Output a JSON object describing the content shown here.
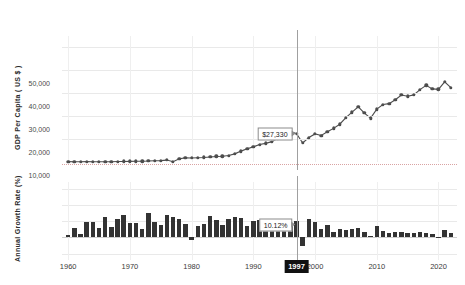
{
  "chart_data": {
    "type": "line",
    "title": "",
    "panels": [
      {
        "name": "gdp-per-capita",
        "type": "line",
        "ylabel": "GDP Per Capita ( US $ )",
        "xlabel": "",
        "ylim": [
          0,
          55000
        ],
        "yticks": [
          10000,
          20000,
          30000,
          40000,
          50000
        ],
        "ytick_labels": [
          "10,000",
          "20,000",
          "30,000",
          "40,000",
          "50,000"
        ],
        "grid": true,
        "x": [
          1960,
          1961,
          1962,
          1963,
          1964,
          1965,
          1966,
          1967,
          1968,
          1969,
          1970,
          1971,
          1972,
          1973,
          1974,
          1975,
          1976,
          1977,
          1978,
          1979,
          1980,
          1981,
          1982,
          1983,
          1984,
          1985,
          1986,
          1987,
          1988,
          1989,
          1990,
          1991,
          1992,
          1993,
          1994,
          1995,
          1996,
          1997,
          1998,
          1999,
          2000,
          2001,
          2002,
          2003,
          2004,
          2005,
          2006,
          2007,
          2008,
          2009,
          2010,
          2011,
          2012,
          2013,
          2014,
          2015,
          2016,
          2017,
          2018,
          2019,
          2020,
          2021,
          2022
        ],
        "values": [
          158,
          94,
          106,
          146,
          124,
          110,
          133,
          101,
          198,
          243,
          279,
          301,
          324,
          407,
          563,
          617,
          834,
          150,
          1408,
          1784,
          1715,
          1883,
          1983,
          2199,
          2413,
          2482,
          2835,
          3555,
          4749,
          5818,
          6610,
          7637,
          8127,
          8885,
          10385,
          12565,
          13404,
          12398,
          8282,
          10672,
          12257,
          11563,
          13165,
          14673,
          16496,
          19403,
          21743,
          24086,
          21350,
          19152,
          23087,
          25096,
          25467,
          27182,
          29250,
          28732,
          29289,
          31616,
          33447,
          31902,
          31721,
          34998,
          32423
        ],
        "annotation": {
          "x": 1997,
          "label": "$27,330"
        }
      },
      {
        "name": "annual-growth-rate",
        "type": "bar",
        "ylabel": "Annual Growth Rate (%)",
        "xlabel": "",
        "ylim": [
          -14,
          34
        ],
        "yticks": [
          -10,
          0,
          10,
          20,
          30
        ],
        "ytick_labels": [
          "-10",
          "0",
          "10",
          "20",
          "30"
        ],
        "grid": true,
        "x": [
          1960,
          1961,
          1962,
          1963,
          1964,
          1965,
          1966,
          1967,
          1968,
          1969,
          1970,
          1971,
          1972,
          1973,
          1974,
          1975,
          1976,
          1977,
          1978,
          1979,
          1980,
          1981,
          1982,
          1983,
          1984,
          1985,
          1986,
          1987,
          1988,
          1989,
          1990,
          1991,
          1992,
          1993,
          1994,
          1995,
          1996,
          1997,
          1998,
          1999,
          2000,
          2001,
          2002,
          2003,
          2004,
          2005,
          2006,
          2007,
          2008,
          2009,
          2010,
          2011,
          2012,
          2013,
          2014,
          2015,
          2016,
          2017,
          2018,
          2019,
          2020,
          2021,
          2022
        ],
        "values": [
          1.6,
          5.6,
          2.2,
          9.1,
          9.6,
          5.8,
          12.2,
          6.2,
          11.3,
          13.8,
          8.8,
          8.6,
          5.1,
          14.9,
          9.5,
          7.8,
          13.5,
          12.3,
          11.0,
          8.4,
          -1.6,
          7.2,
          8.3,
          13.2,
          10.4,
          7.7,
          11.2,
          12.5,
          11.9,
          7.0,
          9.8,
          10.4,
          6.2,
          6.8,
          9.2,
          9.6,
          7.6,
          10.12,
          -5.1,
          11.5,
          9.1,
          4.9,
          7.7,
          3.1,
          5.2,
          4.3,
          5.3,
          5.8,
          3.0,
          0.8,
          6.8,
          3.7,
          2.4,
          3.2,
          3.2,
          2.8,
          2.9,
          3.2,
          2.9,
          2.2,
          -0.7,
          4.3,
          2.6
        ],
        "annotation": {
          "x": 1997,
          "label": "10.12%"
        }
      }
    ],
    "xticks": [
      1960,
      1970,
      1980,
      1990,
      2000,
      2010,
      2020
    ],
    "xtick_labels": [
      "1960",
      "1970",
      "1980",
      "1990",
      "2000",
      "2010",
      "2020"
    ],
    "xlim": [
      1959,
      2023
    ],
    "selected_x": 1997,
    "selected_x_label": "1997",
    "colors": {
      "series": "#4d4d4d",
      "bar": "#333333",
      "grid": "#e9e9e9",
      "crosshair": "#a0a0a0",
      "highlight_bg": "#111111",
      "highlight_text": "#ffffff"
    }
  }
}
